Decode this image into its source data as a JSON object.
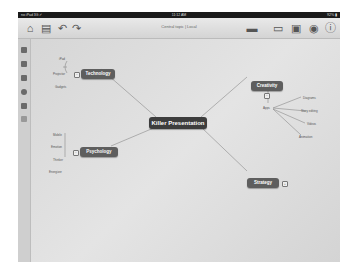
{
  "status_bar": {
    "carrier": "no iPad 3G ✓",
    "time": "11:12 AM",
    "battery": "92% ▮"
  },
  "toolbar": {
    "title": "Central topic | Local",
    "icons": [
      "home-icon",
      "new-document-icon",
      "undo-icon",
      "redo-icon",
      "link-icon",
      "note-icon",
      "share-icon",
      "theme-icon",
      "info-icon"
    ]
  },
  "sidebar": {
    "icons": [
      "page-icon",
      "layout-icon",
      "image-icon",
      "globe-icon",
      "template-icon",
      "grid-icon"
    ]
  },
  "mindmap": {
    "central": "Killer Presentation",
    "topics": [
      {
        "id": "technology",
        "label": "Technology",
        "children": [
          "iPad",
          "Projector",
          "Gadgets"
        ]
      },
      {
        "id": "psychology",
        "label": "Psychology",
        "children": [
          "Mobile",
          "Emotion",
          "Thinker",
          "Energizer"
        ]
      },
      {
        "id": "creativity",
        "label": "Creativity",
        "children": [
          "Apps"
        ],
        "subchildren": [
          "Diagrams",
          "Story editing",
          "Videos",
          "Animation"
        ]
      },
      {
        "id": "strategy",
        "label": "Strategy",
        "children": []
      }
    ]
  }
}
